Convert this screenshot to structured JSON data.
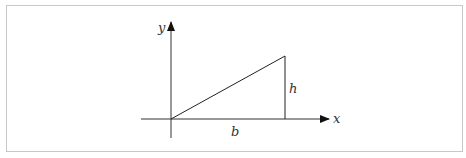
{
  "diagram": {
    "type": "right-triangle-on-axes",
    "axes": {
      "x_label": "x",
      "y_label": "y"
    },
    "triangle": {
      "base_label": "b",
      "height_label": "h"
    },
    "colors": {
      "stroke": "#222222",
      "frame": "#c8c8c8",
      "label": "#333333"
    }
  }
}
